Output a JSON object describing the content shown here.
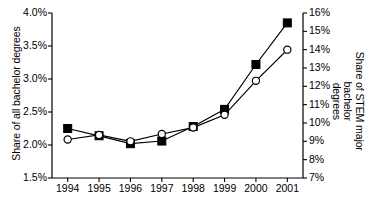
{
  "chart_data": {
    "type": "line",
    "title": "",
    "xlabel": "",
    "categories": [
      "1994",
      "1995",
      "1996",
      "1997",
      "1998",
      "1999",
      "2000",
      "2001"
    ],
    "grid": false,
    "legend": "none",
    "left_axis": {
      "label": "Share of all bachelor degrees",
      "ylim": [
        1.5,
        4.0
      ],
      "tick_step": 0.5,
      "ticks": [
        "1.5%",
        "2.0%",
        "2.5%",
        "3.0%",
        "3.5%",
        "4.0%"
      ],
      "tick_values": [
        1.5,
        2.0,
        2.5,
        3.0,
        3.5,
        4.0
      ]
    },
    "right_axis": {
      "label_line1": "Share of STEM major bachelor",
      "label_line2": "degrees",
      "ylim": [
        7,
        16
      ],
      "tick_step": 1,
      "ticks": [
        "7%",
        "8%",
        "9%",
        "10%",
        "11%",
        "12%",
        "13%",
        "14%",
        "15%",
        "16%"
      ],
      "tick_values": [
        7,
        8,
        9,
        10,
        11,
        12,
        13,
        14,
        15,
        16
      ]
    },
    "series": [
      {
        "name": "Share of all bachelor degrees",
        "axis": "left",
        "marker": "filled-square",
        "color": "#000000",
        "values": [
          2.25,
          2.14,
          2.02,
          2.06,
          2.28,
          2.54,
          3.22,
          3.85
        ]
      },
      {
        "name": "Share of STEM major bachelor degrees",
        "axis": "right",
        "marker": "open-circle",
        "color": "#000000",
        "values": [
          9.1,
          9.35,
          9.0,
          9.4,
          9.75,
          10.45,
          12.3,
          14.0
        ]
      }
    ]
  }
}
